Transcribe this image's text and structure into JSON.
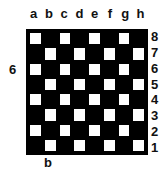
{
  "board": {
    "files": [
      "a",
      "b",
      "c",
      "d",
      "e",
      "f",
      "g",
      "h"
    ],
    "ranks": [
      "8",
      "7",
      "6",
      "5",
      "4",
      "3",
      "2",
      "1"
    ],
    "light_square_color": "#ffffff",
    "dark_square_color": "#000000"
  },
  "annotations": {
    "left_label": "6",
    "bottom_label": "b"
  }
}
